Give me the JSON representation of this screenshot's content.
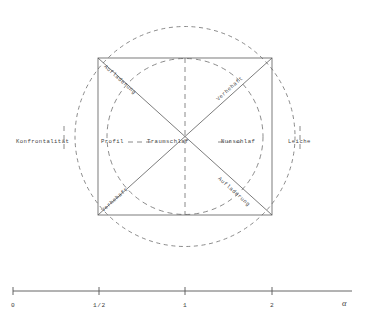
{
  "figure": {
    "title_visible": false,
    "geometry": {
      "square": {
        "left": 98,
        "top": 58,
        "right": 272,
        "bottom": 215
      },
      "center": {
        "x": 185,
        "y": 136.5
      },
      "inner_circle_radius": 78,
      "outer_circle_radius": 110
    },
    "colors": {
      "solid_line": "#5a5a5a",
      "dashed_line": "#6d6d6d",
      "text": "#3f3f3f",
      "background": "#ffffff"
    }
  },
  "labels": {
    "far_left": "Konfrontalität",
    "left_inner": "Profil",
    "center": "Traumschlaf",
    "right_inner": "Nurschlaf",
    "far_right": "Leiche",
    "diag_top_left": "Aufladerung",
    "diag_top_right": "Verhehaft",
    "diag_bottom_left": "Verhehaft",
    "diag_bottom_right": "Aufladerung",
    "dash_connector": "_"
  },
  "axis": {
    "label": "α",
    "ticks": [
      {
        "value": "0",
        "x": 13
      },
      {
        "value": "1/2",
        "x": 99
      },
      {
        "value": "1",
        "x": 185
      },
      {
        "value": "2",
        "x": 272
      }
    ],
    "line": {
      "x1": 13,
      "x2": 352,
      "y": 291
    }
  }
}
